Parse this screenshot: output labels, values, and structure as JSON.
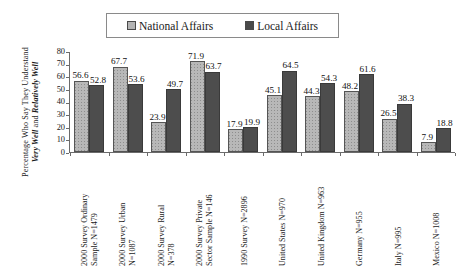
{
  "chart_data": {
    "type": "bar",
    "title": "",
    "xlabel": "",
    "ylabel": "Percentage Who Say They Understand Very Well and Relatively Well",
    "ylabel_line1": "Percentage Who Say They Understand",
    "ylabel_line2_a": "Very Well",
    "ylabel_line2_b": " and ",
    "ylabel_line2_c": "Relatively Well",
    "ylim": [
      0,
      80
    ],
    "yticks": [
      0,
      10,
      20,
      30,
      40,
      50,
      60,
      70,
      80
    ],
    "grid": false,
    "legend_position": "top-center",
    "categories": [
      "2000 Survey Ordinary Sample N=1479",
      "2000 Survey Urban N=1087",
      "2000 Survey Rural N=378",
      "2000 Survey Private Sector Sample N=146",
      "1990 Survey N=2896",
      "United States  N=970",
      "United Kingdom N=963",
      "Germany N=955",
      "Italy N=995",
      "Mexico N=1008"
    ],
    "category_lines": [
      [
        "2000 Survey Ordinary",
        "Sample N=1479"
      ],
      [
        "2000 Survey Urban",
        "N=1087"
      ],
      [
        "2000 Survey Rural",
        "N=378"
      ],
      [
        "2000 Survey Private",
        "Sector Sample N=146"
      ],
      [
        "1990 Survey N=2896"
      ],
      [
        "United States  N=970"
      ],
      [
        "United Kingdom N=963"
      ],
      [
        "Germany N=955"
      ],
      [
        "Italy N=995"
      ],
      [
        "Mexico N=1008"
      ]
    ],
    "series": [
      {
        "name": "National Affairs",
        "color": "#b8b8b8",
        "values": [
          56.6,
          67.7,
          23.9,
          71.9,
          17.9,
          45.1,
          44.3,
          48.2,
          26.5,
          7.9
        ]
      },
      {
        "name": "Local Affairs",
        "color": "#4d4d4d",
        "values": [
          52.8,
          53.6,
          49.7,
          63.7,
          19.9,
          64.5,
          54.3,
          61.6,
          38.3,
          18.8
        ]
      }
    ]
  },
  "legend": {
    "items": [
      {
        "label": "National Affairs",
        "swatch": "national"
      },
      {
        "label": "Local Affairs",
        "swatch": "local"
      }
    ]
  }
}
